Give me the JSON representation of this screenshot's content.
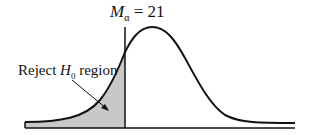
{
  "diagram": {
    "type": "normal-distribution",
    "critical_value_label": {
      "symbol": "M",
      "subscript": "α",
      "equals": "= 21"
    },
    "rejection_label": {
      "prefix": "Reject ",
      "symbol": "H",
      "subscript": "0",
      "suffix": " region"
    },
    "colors": {
      "curve": "#111111",
      "shade": "#c8c8c8",
      "axis": "#111111"
    }
  }
}
